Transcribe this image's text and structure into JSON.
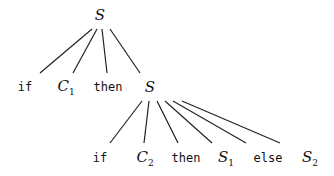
{
  "diagram": {
    "type": "parse-tree",
    "root": {
      "label": "S",
      "x": 100,
      "y": 15
    },
    "level1": [
      {
        "label": "if",
        "kind": "keyword",
        "x": 25,
        "y": 87,
        "line_end": [
          40,
          73
        ]
      },
      {
        "label": "C",
        "sub": "1",
        "kind": "variable",
        "x": 66,
        "y": 87,
        "line_end": [
          73,
          73
        ]
      },
      {
        "label": "then",
        "kind": "keyword",
        "x": 108,
        "y": 87,
        "line_end": [
          107,
          73
        ]
      },
      {
        "label": "S",
        "sub": "",
        "kind": "variable",
        "x": 150,
        "y": 87,
        "line_end": [
          140,
          73
        ]
      }
    ],
    "root_line_start": [
      [
        92,
        29
      ],
      [
        97,
        29
      ],
      [
        102,
        29
      ],
      [
        110,
        29
      ]
    ],
    "subroot": {
      "x": 150,
      "y": 87
    },
    "subroot_line_start": [
      [
        142,
        101
      ],
      [
        149,
        101
      ],
      [
        157,
        101
      ],
      [
        165,
        101
      ],
      [
        173,
        101
      ],
      [
        182,
        101
      ]
    ],
    "level2": [
      {
        "label": "if",
        "kind": "keyword",
        "x": 100,
        "y": 158,
        "line_end": [
          110,
          143
        ]
      },
      {
        "label": "C",
        "sub": "2",
        "kind": "variable",
        "x": 145,
        "y": 158,
        "line_end": [
          144,
          143
        ]
      },
      {
        "label": "then",
        "kind": "keyword",
        "x": 186,
        "y": 158,
        "line_end": [
          178,
          143
        ]
      },
      {
        "label": "S",
        "sub": "1",
        "kind": "variable",
        "x": 226,
        "y": 158,
        "line_end": [
          212,
          143
        ]
      },
      {
        "label": "else",
        "kind": "keyword",
        "x": 268,
        "y": 158,
        "line_end": [
          246,
          143
        ]
      },
      {
        "label": "S",
        "sub": "2",
        "kind": "variable",
        "x": 310,
        "y": 158,
        "line_end": [
          280,
          143
        ]
      }
    ]
  }
}
